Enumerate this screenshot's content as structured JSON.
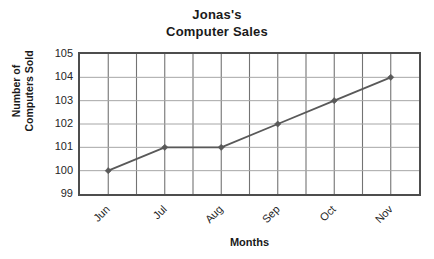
{
  "chart_data": {
    "type": "line",
    "title": "Jonas's Computer Sales",
    "title_lines": [
      "Jonas's",
      "Computer Sales"
    ],
    "categories": [
      "Jun",
      "Jul",
      "Aug",
      "Sep",
      "Oct",
      "Nov"
    ],
    "values": [
      100,
      101,
      101,
      102,
      103,
      104
    ],
    "series": [
      {
        "name": "Number of Computers Sold",
        "values": [
          100,
          101,
          101,
          102,
          103,
          104
        ]
      }
    ],
    "xlabel": "Months",
    "ylabel": "Number of Computers Sold",
    "ylabel_lines": [
      "Number of",
      "Computers Sold"
    ],
    "ylim": [
      99,
      105
    ],
    "yticks": [
      105,
      104,
      103,
      102,
      101,
      100,
      99
    ],
    "ytick_labels": [
      "105",
      "104",
      "103",
      "102",
      "101",
      "100",
      "99"
    ],
    "grid": true,
    "grid_columns": 12,
    "grid_rows": 6,
    "legend": "none",
    "marker": "diamond",
    "colors": {
      "line": "#595959",
      "marker": "#595959",
      "border": "#4d4d4d",
      "gridline_vertical": "#737373",
      "gridline_horizontal": "#a6a6a6",
      "background": "#ffffff",
      "text": "#1a1a1a"
    }
  }
}
